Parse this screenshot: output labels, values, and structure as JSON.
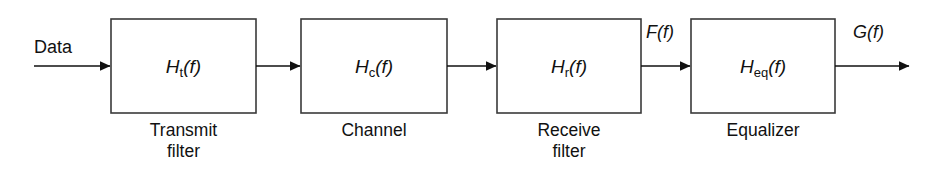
{
  "diagram": {
    "background_color": "#ffffff",
    "stroke_color": "#3a3a3a",
    "line_color": "#111111",
    "input": {
      "label": "Data"
    },
    "blocks": [
      {
        "id": "transmit-filter",
        "tf_main": "H",
        "tf_sub": "t",
        "tf_arg": "(f)",
        "caption": "Transmit\nfilter",
        "x": 111,
        "y": 19,
        "w": 145,
        "h": 94
      },
      {
        "id": "channel",
        "tf_main": "H",
        "tf_sub": "c",
        "tf_arg": "(f)",
        "caption": "Channel",
        "x": 301,
        "y": 19,
        "w": 146,
        "h": 94
      },
      {
        "id": "receive-filter",
        "tf_main": "H",
        "tf_sub": "r",
        "tf_arg": "(f)",
        "caption": "Receive\nfilter",
        "x": 497,
        "y": 19,
        "w": 144,
        "h": 94
      },
      {
        "id": "equalizer",
        "tf_main": "H",
        "tf_sub": "eq",
        "tf_arg": "(f)",
        "caption": "Equalizer",
        "x": 691,
        "y": 19,
        "w": 144,
        "h": 94
      }
    ],
    "signal_labels": [
      {
        "id": "f-of-f",
        "main": "F",
        "arg": "(f)",
        "x": 646,
        "y": 23
      },
      {
        "id": "g-of-f",
        "main": "G",
        "arg": "(f)",
        "x": 853,
        "y": 23
      }
    ]
  }
}
